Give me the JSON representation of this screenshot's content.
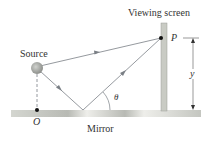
{
  "labels": {
    "viewing_screen": "Viewing screen",
    "source": "Source",
    "point_p": "P",
    "distance_y": "y",
    "angle": "θ",
    "origin": "O",
    "mirror": "Mirror"
  },
  "colors": {
    "ray": "#7a7f85",
    "screen": "#c9cbc4",
    "mirror": "#c4c6c0",
    "source": "#a8aaa6",
    "text": "#333333"
  }
}
